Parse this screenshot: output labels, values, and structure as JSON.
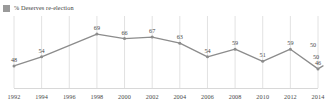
{
  "legend": {
    "swatch_color": "#9a9a9a",
    "label": "% Deserves re-election"
  },
  "colors": {
    "line": "#8c8c8c",
    "marker": "#8c8c8c",
    "gridline": "#e2e2e2",
    "baseline": "#d8d8d8",
    "label_text": "#4a4a4a"
  },
  "chart_data": {
    "type": "line",
    "title": "",
    "xlabel": "",
    "ylabel": "",
    "grid": "vertical",
    "legend_position": "top-left",
    "ylim": [
      40,
      75
    ],
    "categories": [
      "1992",
      "1994",
      "1996",
      "1998",
      "2000",
      "2002",
      "2004",
      "2006",
      "2008",
      "2010",
      "2012",
      "2014"
    ],
    "series": [
      {
        "name": "% Deserves re-election",
        "values": [
          48,
          54,
          null,
          69,
          66,
          67,
          63,
          54,
          59,
          51,
          59,
          46
        ]
      }
    ],
    "point_labels": [
      "48",
      "54",
      "",
      "69",
      "66",
      "67",
      "63",
      "54",
      "59",
      "51",
      "59",
      "46"
    ],
    "extra_labels": [
      {
        "text": "50",
        "x": 313,
        "y": 47
      },
      {
        "text": "50",
        "x": 316,
        "y": 59
      }
    ],
    "annotation_note": "Final 2014 cluster shows a dip to 46 with two nearby values of 50"
  }
}
